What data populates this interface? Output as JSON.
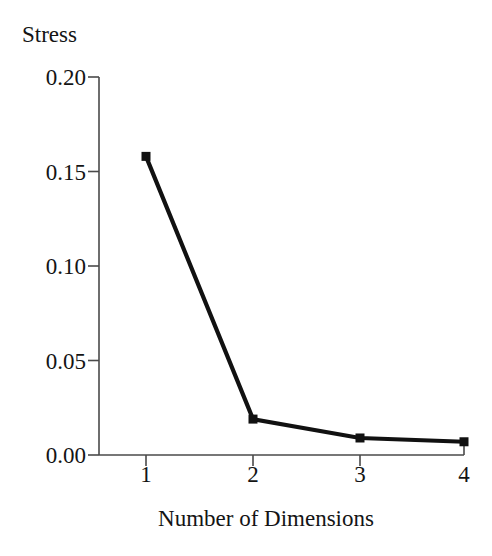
{
  "chart_data": {
    "type": "line",
    "title": "",
    "subtitle": "",
    "xlabel": "Number of Dimensions",
    "ylabel": "Stress",
    "x": [
      1,
      2,
      3,
      4
    ],
    "values": [
      0.158,
      0.019,
      0.009,
      0.007
    ],
    "series": [
      {
        "name": "Stress",
        "values": [
          0.158,
          0.019,
          0.009,
          0.007
        ]
      }
    ],
    "categories": [
      "1",
      "2",
      "3",
      "4"
    ],
    "xlim": [
      0.6,
      4.4
    ],
    "ylim": [
      0.0,
      0.2
    ],
    "xticks": [
      1,
      2,
      3,
      4
    ],
    "xtick_labels": [
      "1",
      "2",
      "3",
      "4"
    ],
    "yticks": [
      0.0,
      0.05,
      0.1,
      0.15,
      0.2
    ],
    "ytick_labels": [
      "0.00",
      "0.05",
      "0.10",
      "0.15",
      "0.20"
    ],
    "grid": false,
    "legend": false,
    "legend_position": "none",
    "marker": "square",
    "line_color": "#111111",
    "marker_color": "#111111",
    "axis_color": "#4a4a4a",
    "background_color": "#ffffff",
    "annotations": []
  }
}
